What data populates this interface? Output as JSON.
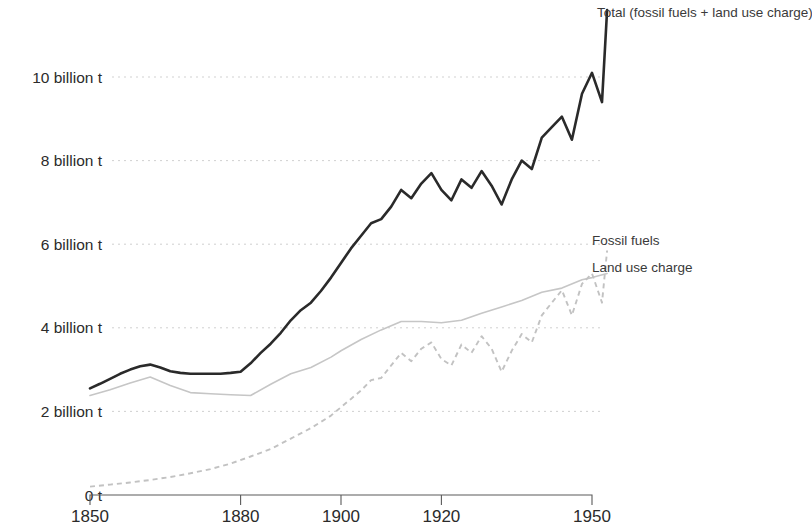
{
  "chart_data": {
    "type": "line",
    "title": "",
    "subtitle": "",
    "xlabel": "",
    "ylabel": "",
    "xlim": [
      1850,
      1955
    ],
    "ylim": [
      0,
      11.8
    ],
    "grid": true,
    "legend_position": "right-inline-end-of-line",
    "y_tick_labels": [
      "10 billion t",
      "8 billion t",
      "6 billion t",
      "4 billion t",
      "2 billion t",
      "0 t"
    ],
    "y_tick_values": [
      10,
      8,
      6,
      4,
      2,
      0
    ],
    "x_tick_labels": [
      "1850",
      "1880",
      "1900",
      "1920",
      "1950"
    ],
    "x_tick_values": [
      1850,
      1880,
      1900,
      1920,
      1950
    ],
    "units": "billion tonnes",
    "colors": {
      "total": "#2a2a2a",
      "fossil_fuels": "#c2c2c2",
      "land_use_charge": "#c6c6c6",
      "gridline": "#c9c9c9",
      "axis": "#5a5a5a",
      "background": "#ffffff"
    },
    "series": [
      {
        "name": "Total (fossil fuels + land use charge)",
        "style": "solid",
        "color": "#2a2a2a",
        "x": [
          1850,
          1852,
          1854,
          1856,
          1858,
          1860,
          1862,
          1864,
          1866,
          1868,
          1870,
          1872,
          1874,
          1876,
          1878,
          1880,
          1882,
          1884,
          1886,
          1888,
          1890,
          1892,
          1894,
          1896,
          1898,
          1900,
          1902,
          1904,
          1906,
          1908,
          1910,
          1912,
          1914,
          1916,
          1918,
          1920,
          1922,
          1924,
          1926,
          1928,
          1930,
          1932,
          1934,
          1936,
          1938,
          1940,
          1942,
          1944,
          1946,
          1948,
          1950,
          1952,
          1953
        ],
        "values": [
          2.55,
          2.66,
          2.78,
          2.9,
          3.0,
          3.08,
          3.12,
          3.05,
          2.96,
          2.92,
          2.9,
          2.9,
          2.9,
          2.9,
          2.92,
          2.95,
          3.15,
          3.4,
          3.62,
          3.88,
          4.18,
          4.42,
          4.6,
          4.88,
          5.2,
          5.55,
          5.9,
          6.2,
          6.5,
          6.6,
          6.9,
          7.3,
          7.1,
          7.45,
          7.7,
          7.3,
          7.05,
          7.55,
          7.35,
          7.75,
          7.4,
          6.95,
          7.55,
          8.0,
          7.8,
          8.55,
          8.8,
          9.05,
          8.5,
          9.6,
          10.1,
          9.4,
          11.6
        ]
      },
      {
        "name": "Fossil fuels",
        "style": "dashed",
        "color": "#c2c2c2",
        "x": [
          1850,
          1854,
          1858,
          1862,
          1866,
          1870,
          1874,
          1878,
          1882,
          1886,
          1890,
          1894,
          1898,
          1900,
          1902,
          1904,
          1906,
          1908,
          1910,
          1912,
          1914,
          1916,
          1918,
          1920,
          1922,
          1924,
          1926,
          1928,
          1930,
          1932,
          1934,
          1936,
          1938,
          1940,
          1942,
          1944,
          1946,
          1948,
          1950,
          1952,
          1953
        ],
        "values": [
          0.2,
          0.25,
          0.3,
          0.36,
          0.43,
          0.52,
          0.62,
          0.75,
          0.92,
          1.1,
          1.35,
          1.6,
          1.9,
          2.1,
          2.3,
          2.5,
          2.75,
          2.8,
          3.1,
          3.4,
          3.2,
          3.5,
          3.65,
          3.25,
          3.1,
          3.6,
          3.4,
          3.8,
          3.5,
          2.95,
          3.45,
          3.85,
          3.65,
          4.3,
          4.6,
          4.9,
          4.3,
          5.05,
          5.3,
          4.6,
          5.85
        ]
      },
      {
        "name": "Land use charge",
        "style": "solid",
        "color": "#c6c6c6",
        "x": [
          1850,
          1854,
          1858,
          1862,
          1866,
          1870,
          1874,
          1878,
          1882,
          1886,
          1890,
          1894,
          1898,
          1900,
          1904,
          1908,
          1912,
          1916,
          1920,
          1924,
          1928,
          1932,
          1936,
          1940,
          1944,
          1948,
          1950,
          1953
        ],
        "values": [
          2.38,
          2.52,
          2.68,
          2.82,
          2.62,
          2.45,
          2.42,
          2.4,
          2.38,
          2.65,
          2.9,
          3.05,
          3.3,
          3.45,
          3.72,
          3.95,
          4.15,
          4.15,
          4.12,
          4.18,
          4.35,
          4.5,
          4.65,
          4.85,
          4.95,
          5.15,
          5.2,
          5.3
        ]
      }
    ],
    "annotations": [
      {
        "text": "Total (fossil fuels + land use charge)",
        "series": "total"
      },
      {
        "text": "Fossil fuels",
        "series": "fossil_fuels"
      },
      {
        "text": "Land use charge",
        "series": "land_use_charge"
      }
    ]
  }
}
